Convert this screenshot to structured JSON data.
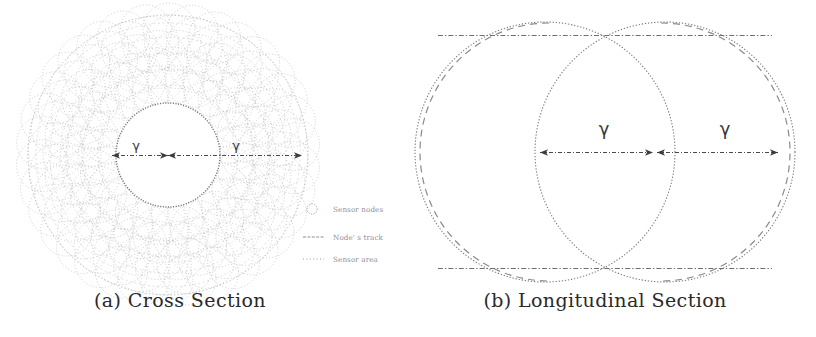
{
  "figure": {
    "background_color": "#ffffff",
    "ink_color": "#555555",
    "panels": [
      {
        "id": "cross-section",
        "caption": "(a) Cross Section",
        "label_left": "γ",
        "label_right": "γ",
        "geometry": {
          "center_x": 168,
          "center_y": 155,
          "inner_radius": 52,
          "outer_radius": 140,
          "arrow_inner_label_x": 136,
          "arrow_outer_label_x": 236
        }
      },
      {
        "id": "longitudinal-section",
        "caption": "(b) Longitudinal Section",
        "label_left": "γ",
        "label_right": "γ",
        "geometry": {
          "left_center_x": 545,
          "right_center_x": 665,
          "center_y": 152,
          "radius": 130,
          "arrow_label_left_x": 605,
          "arrow_label_right_x": 725
        }
      }
    ],
    "legend": {
      "items": [
        {
          "marker": "circle-outline-icon",
          "label": "Sensor nodes"
        },
        {
          "marker": "dashed-line-icon",
          "label": "Node' s track"
        },
        {
          "marker": "dotted-line-icon",
          "label": "Sensor area"
        }
      ]
    }
  }
}
